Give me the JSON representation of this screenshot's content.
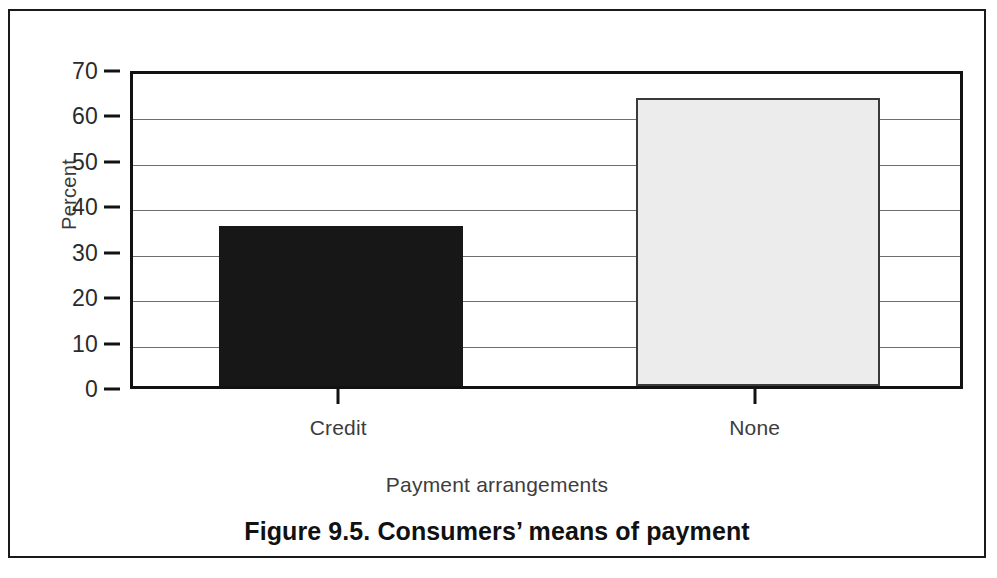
{
  "figure": {
    "caption": "Figure 9.5. Consumers’ means of payment",
    "frame_color": "#1a1a1a",
    "background": "#ffffff"
  },
  "chart_data": {
    "type": "bar",
    "title": "Figure 9.5. Consumers’ means of payment",
    "xlabel": "Payment arrangements",
    "ylabel": "Percent",
    "categories": [
      "Credit",
      "None"
    ],
    "values": [
      35.3,
      63.5
    ],
    "series": [
      {
        "name": "Percent of consumers",
        "values": [
          35.3,
          63.5
        ]
      }
    ],
    "bar_colors": [
      "#171717",
      "#ececec"
    ],
    "bar_edge_colors": [
      "#171717",
      "#3a3a3a"
    ],
    "ylim": [
      0,
      70
    ],
    "yticks": [
      0,
      10,
      20,
      30,
      40,
      50,
      60,
      70
    ],
    "ytick_labels": [
      "0",
      "10",
      "20",
      "30",
      "40",
      "50",
      "60",
      "70"
    ],
    "xtick_labels": [
      "Credit",
      "None"
    ],
    "grid": true,
    "grid_axis": "y",
    "grid_color": "#6f6f6f",
    "legend": false,
    "legend_position": "none",
    "plot_border": true,
    "data_labels": false
  }
}
